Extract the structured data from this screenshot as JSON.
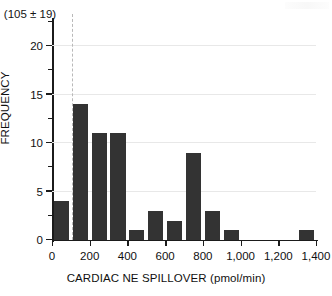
{
  "chart_data": {
    "type": "bar",
    "title": "",
    "subtitle": "",
    "xlabel": "CARDIAC NE SPILLOVER (pmol/min)",
    "ylabel": "FREQUENCY",
    "xlim": [
      0,
      1400
    ],
    "ylim": [
      0,
      22.5
    ],
    "grid": true,
    "legend": null,
    "bin_width": 100,
    "categories": [
      "0-100",
      "100-200",
      "200-300",
      "300-400",
      "400-500",
      "500-600",
      "600-700",
      "700-800",
      "800-900",
      "900-1000",
      "1000-1100",
      "1100-1200",
      "1200-1300",
      "1300-1400"
    ],
    "bin_starts": [
      0,
      100,
      200,
      300,
      400,
      500,
      600,
      700,
      800,
      900,
      1000,
      1100,
      1200,
      1300
    ],
    "values": [
      4,
      14,
      11,
      11,
      1,
      3,
      2,
      9,
      3,
      1,
      0,
      0,
      0,
      1
    ],
    "x_ticks": [
      0,
      200,
      400,
      600,
      800,
      1000,
      1200,
      1400
    ],
    "x_tick_labels": [
      "0",
      "200",
      "400",
      "600",
      "800",
      "1,000",
      "1,200",
      "1,400"
    ],
    "y_ticks": [
      0,
      5,
      10,
      15,
      20
    ],
    "y_tick_labels": [
      "0",
      "5",
      "10",
      "15",
      "20"
    ],
    "y_minor_ticks": [
      2.5,
      7.5,
      12.5,
      17.5,
      22.5
    ],
    "annotations": [
      {
        "name": "mean-sd-annotation",
        "text": "(105 ± 19)",
        "x_value": 105,
        "style": "dashed-vertical-line"
      }
    ],
    "bar_color": "#333333",
    "grid_color": "#e8e8e8",
    "axis_color": "#1b1b1b",
    "annotation_line_color": "#b9b9b9"
  }
}
